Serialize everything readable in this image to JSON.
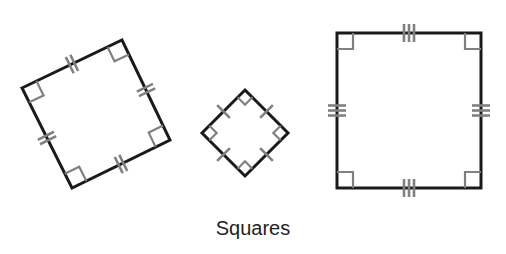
{
  "figure": {
    "caption": "Squares",
    "caption_position": {
      "x": 253,
      "y": 235
    },
    "background_color": "#ffffff",
    "edge_color": "#1a1a1a",
    "marker_color": "#808080",
    "caption_color": "#231f20",
    "shape_count": 3,
    "shapes": [
      {
        "name": "rotated-square-left",
        "type": "square",
        "rotation_degrees": 25,
        "tick_marks_per_side": 2,
        "right_angle_markers": 4,
        "side_length": 111,
        "center": {
          "x": 96,
          "y": 114
        },
        "vertices": [
          {
            "x": 22,
            "y": 88
          },
          {
            "x": 122,
            "y": 40
          },
          {
            "x": 170,
            "y": 140
          },
          {
            "x": 72,
            "y": 188
          }
        ],
        "edge_width": 3
      },
      {
        "name": "diamond-square-middle",
        "type": "square",
        "rotation_degrees": 45,
        "tick_marks_per_side": 1,
        "right_angle_markers": 4,
        "side_length": 61,
        "center": {
          "x": 245,
          "y": 133
        },
        "vertices": [
          {
            "x": 245,
            "y": 90
          },
          {
            "x": 288,
            "y": 133
          },
          {
            "x": 245,
            "y": 176
          },
          {
            "x": 202,
            "y": 133
          }
        ],
        "edge_width": 3
      },
      {
        "name": "axis-aligned-square-right",
        "type": "square",
        "rotation_degrees": 0,
        "tick_marks_per_side": 3,
        "right_angle_markers": 4,
        "side_length": 149,
        "center": {
          "x": 409,
          "y": 110
        },
        "vertices": [
          {
            "x": 337,
            "y": 33
          },
          {
            "x": 481,
            "y": 33
          },
          {
            "x": 481,
            "y": 188
          },
          {
            "x": 337,
            "y": 188
          }
        ],
        "edge_width": 3
      }
    ]
  }
}
